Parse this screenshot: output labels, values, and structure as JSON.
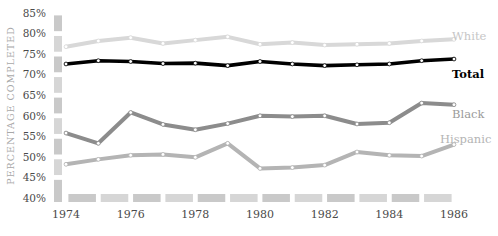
{
  "chart_data": {
    "type": "line",
    "title": "",
    "subtitle": "",
    "xlabel": "",
    "ylabel": "PERCENTAGE COMPLETED",
    "x": [
      1974,
      1975,
      1976,
      1977,
      1978,
      1979,
      1980,
      1981,
      1982,
      1983,
      1984,
      1985,
      1986
    ],
    "xtick_labels": [
      "1974",
      "1976",
      "1978",
      "1980",
      "1982",
      "1984",
      "1986"
    ],
    "xtick_values": [
      1974,
      1976,
      1978,
      1980,
      1982,
      1984,
      1986
    ],
    "xlim": [
      1974,
      1986
    ],
    "ylim": [
      40,
      85
    ],
    "ytick_labels": [
      "40%",
      "45%",
      "50%",
      "55%",
      "60%",
      "65%",
      "70%",
      "75%",
      "80%",
      "85%"
    ],
    "ytick_values": [
      40,
      45,
      50,
      55,
      60,
      65,
      70,
      75,
      80,
      85
    ],
    "grid": false,
    "legend_position": "inline-right",
    "markers": "circle",
    "series": [
      {
        "name": "White",
        "color": "#d8d8d8",
        "label_color": "#c6c6c6",
        "width": 4.0,
        "values": [
          76.8,
          78.2,
          79.0,
          77.6,
          78.4,
          79.2,
          77.4,
          77.8,
          77.2,
          77.4,
          77.6,
          78.2,
          78.6
        ]
      },
      {
        "name": "Total",
        "color": "#000000",
        "label_color": "#000000",
        "width": 3.6,
        "values": [
          72.6,
          73.4,
          73.2,
          72.7,
          72.8,
          72.2,
          73.2,
          72.6,
          72.2,
          72.4,
          72.6,
          73.4,
          73.8
        ]
      },
      {
        "name": "Black",
        "color": "#8c8c8c",
        "label_color": "#9a9a9a",
        "width": 4.0,
        "values": [
          55.8,
          53.3,
          60.8,
          57.9,
          56.6,
          58.1,
          60.0,
          59.8,
          60.0,
          58.0,
          58.3,
          63.1,
          62.7
        ]
      },
      {
        "name": "Hispanic",
        "color": "#b4b4b4",
        "label_color": "#b4b4b4",
        "width": 4.0,
        "values": [
          48.2,
          49.4,
          50.4,
          50.6,
          49.9,
          53.3,
          47.2,
          47.4,
          48.0,
          51.2,
          50.4,
          50.2,
          53.0
        ]
      }
    ]
  },
  "axis": {
    "bar_color": "#c9c9c9",
    "bar_color_alt": "#d6d6d6"
  }
}
